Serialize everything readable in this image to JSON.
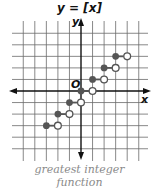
{
  "title": {
    "lhs": "y",
    "eq": " = ",
    "rhs": "[x]"
  },
  "axes": {
    "x_label": "x",
    "y_label": "y",
    "origin_label": "O"
  },
  "caption": {
    "line1": "greatest integer",
    "line2": "function"
  },
  "colors": {
    "grid": "#666666",
    "axis": "#111111",
    "point": "#555555",
    "caption": "#8a8a8a"
  },
  "chart_data": {
    "type": "step",
    "title": "y = [x]",
    "subtitle": "greatest integer function",
    "xlabel": "x",
    "ylabel": "y",
    "xlim": [
      -6,
      6
    ],
    "ylim": [
      -5,
      5
    ],
    "grid": true,
    "segments": [
      {
        "x_start": -3,
        "x_end": -2,
        "y": -3,
        "closed_start": true,
        "open_end": true
      },
      {
        "x_start": -2,
        "x_end": -1,
        "y": -2,
        "closed_start": true,
        "open_end": true
      },
      {
        "x_start": -1,
        "x_end": 0,
        "y": -1,
        "closed_start": true,
        "open_end": true
      },
      {
        "x_start": 0,
        "x_end": 1,
        "y": 0,
        "closed_start": true,
        "open_end": true
      },
      {
        "x_start": 1,
        "x_end": 2,
        "y": 1,
        "closed_start": true,
        "open_end": true
      },
      {
        "x_start": 2,
        "x_end": 3,
        "y": 2,
        "closed_start": true,
        "open_end": true
      },
      {
        "x_start": 3,
        "x_end": 4,
        "y": 3,
        "closed_start": true,
        "open_end": true
      }
    ]
  }
}
